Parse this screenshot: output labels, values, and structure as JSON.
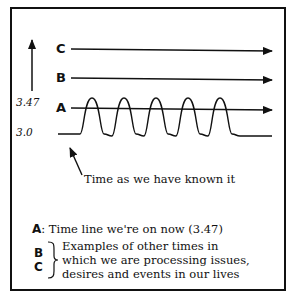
{
  "diagram": {
    "y_axis": {
      "ticks": [
        "3.47",
        "3.0"
      ]
    },
    "lines": [
      {
        "key": "C",
        "type": "straight-arrow"
      },
      {
        "key": "B",
        "type": "straight-arrow"
      },
      {
        "key": "A",
        "type": "straight-arrow-with-wave"
      }
    ],
    "pointer_caption": "Time as we have known it",
    "legend": {
      "a_key": "A",
      "a_text": ": Time line we're on now (3.47)",
      "bc_keys": [
        "B",
        "C"
      ],
      "bc_text_lines": [
        "Examples of other times in",
        "which we are processing issues,",
        "desires and events in our lives"
      ]
    }
  }
}
